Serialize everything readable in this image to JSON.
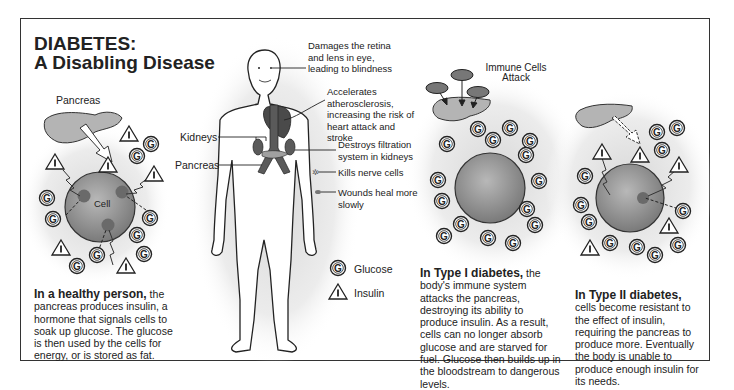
{
  "title": {
    "line1": "DIABETES:",
    "line2": "A Disabling Disease"
  },
  "panels": {
    "healthy": {
      "pancreas_label": "Pancreas",
      "cell_label": "Cell",
      "caption_bold": "In a healthy person,",
      "caption_text": " the pancreas produces insulin, a hormone that signals cells to soak up glucose. The glucose is then used by the cells for energy, or is stored as fat."
    },
    "body": {
      "left_labels": [
        "Kidneys",
        "Pancreas"
      ],
      "callouts": [
        "Damages the retina and lens in eye, leading to blindness",
        "Accelerates atherosclerosis, increasing the risk of heart attack and stroke",
        "Destroys filtration system in kidneys",
        "Kills nerve cells",
        "Wounds heal more slowly"
      ]
    },
    "legend": {
      "items": [
        {
          "symbol": "G",
          "icon": "glucose-icon",
          "label": "Glucose"
        },
        {
          "symbol": "I",
          "icon": "insulin-icon",
          "label": "Insulin"
        }
      ]
    },
    "type1": {
      "attack_label_line1": "Immune Cells",
      "attack_label_line2": "Attack",
      "caption_bold": "In Type I diabetes,",
      "caption_text": " the body's immune system attacks the pancreas, destroying its ability to produce insulin. As a result, cells can no longer absorb glucose and are starved for fuel. Glucose then builds up in the bloodstream to dangerous levels."
    },
    "type2": {
      "caption_bold": "In Type II diabetes,",
      "caption_text": " cells become resistant to the effect of insulin, requiring the pancreas to produce more. Eventually the body is unable to produce enough insulin for its needs."
    }
  },
  "colors": {
    "frame": "#333333",
    "cell_fill": "#8a8a8a",
    "pancreas_fill": "#b0b0b0",
    "organ_fill": "#555555",
    "halo": "#e2e2e2"
  }
}
